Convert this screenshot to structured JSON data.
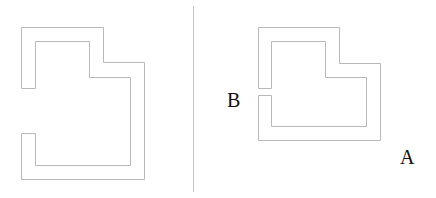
{
  "figure": {
    "left_panel": {
      "shape": "l-shaped-corridor",
      "opening": "wide-left-gap"
    },
    "right_panel": {
      "shape": "l-shaped-corridor",
      "opening": "narrow-left-gap",
      "labels": {
        "entrance": "B",
        "exterior": "A"
      }
    },
    "colors": {
      "stroke": "#b8b8b8",
      "label": "#111111",
      "background": "#ffffff"
    }
  }
}
